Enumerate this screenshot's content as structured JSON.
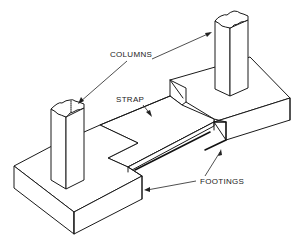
{
  "diagram": {
    "colors": {
      "line": "#1a1a1a",
      "background": "#ffffff"
    },
    "labels": {
      "columns": "COLUMNS",
      "strap": "STRAP",
      "footings": "FOOTINGS"
    },
    "components": [
      {
        "id": "column-left",
        "type": "column"
      },
      {
        "id": "column-right",
        "type": "column"
      },
      {
        "id": "strap",
        "type": "strap"
      },
      {
        "id": "footing-left",
        "type": "footing"
      },
      {
        "id": "footing-right",
        "type": "footing"
      }
    ]
  }
}
